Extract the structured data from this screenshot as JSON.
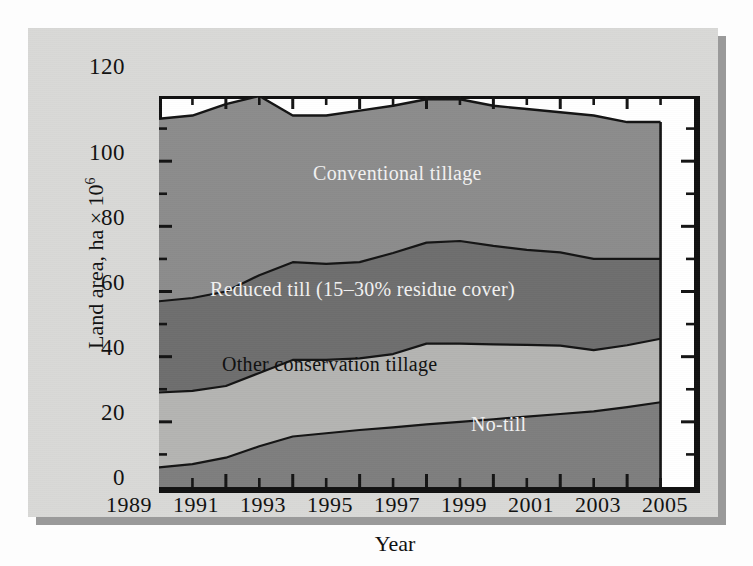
{
  "figure": {
    "background_color": "#d9d9d7",
    "shadow_color": "#9a9a9a",
    "frame_color": "#111111"
  },
  "axes": {
    "y_title_text": "Land area, ha × 10",
    "y_title_exponent": "6",
    "y_title_full": "Land area, ha × 10⁶",
    "x_title": "Year",
    "y_ticks": [
      "0",
      "20",
      "40",
      "60",
      "80",
      "100",
      "120"
    ],
    "y_tick_values": [
      0,
      20,
      40,
      60,
      80,
      100,
      120
    ],
    "y_minor_tick_values": [
      10,
      30,
      50,
      70,
      90,
      110
    ],
    "x_ticks": [
      "1989",
      "1991",
      "1993",
      "1995",
      "1997",
      "1999",
      "2001",
      "2003",
      "2005"
    ],
    "x_tick_values": [
      1989,
      1991,
      1993,
      1995,
      1997,
      1999,
      2001,
      2003,
      2005
    ],
    "x_minor_tick_values": [
      1990,
      1992,
      1994,
      1996,
      1998,
      2000,
      2002,
      2004
    ],
    "ylim": [
      0,
      120
    ],
    "xlim": [
      1989,
      2005
    ]
  },
  "series_labels": {
    "conventional": "Conventional tillage",
    "reduced": "Reduced till (15–30% residue cover)",
    "other": "Other conservation tillage",
    "notill": "No-till"
  },
  "colors": {
    "conventional": "#8c8c8c",
    "reduced": "#6e6e6e",
    "other": "#b4b4b2",
    "notill": "#7e7e7e",
    "plot_background": "#ffffff",
    "line": "#141414",
    "label_light": "#f2f2f2",
    "label_dark": "#101010"
  },
  "chart_data": {
    "type": "area",
    "title": "",
    "subtitle": "",
    "xlabel": "Year",
    "ylabel": "Land area, ha × 10⁶",
    "xlim": [
      1989,
      2005
    ],
    "ylim": [
      0,
      120
    ],
    "grid": false,
    "legend": "inline-labels",
    "stacked": true,
    "x": [
      1989,
      1990,
      1991,
      1992,
      1993,
      1994,
      1995,
      1996,
      1997,
      1998,
      1999,
      2000,
      2001,
      2002,
      2003,
      2004
    ],
    "series": [
      {
        "name": "No-till",
        "color": "#7e7e7e",
        "values": [
          6.0,
          7.0,
          9.0,
          12.5,
          15.5,
          16.5,
          17.5,
          18.3,
          19.2,
          20.0,
          20.8,
          21.6,
          22.4,
          23.2,
          24.5,
          26.0
        ]
      },
      {
        "name": "Other conservation tillage",
        "color": "#b4b4b2",
        "values": [
          23.0,
          22.5,
          22.0,
          22.5,
          23.5,
          22.5,
          22.0,
          22.5,
          24.8,
          24.0,
          23.0,
          22.0,
          21.0,
          18.8,
          19.0,
          19.5
        ]
      },
      {
        "name": "Reduced till (15–30% residue cover)",
        "color": "#6e6e6e",
        "values": [
          28.0,
          28.5,
          29.0,
          30.0,
          30.0,
          29.5,
          29.5,
          31.0,
          31.0,
          31.5,
          30.2,
          29.2,
          28.6,
          28.0,
          26.5,
          24.5
        ]
      },
      {
        "name": "Conventional tillage",
        "color": "#8c8c8c",
        "values": [
          56.0,
          56.0,
          57.5,
          55.0,
          45.0,
          45.5,
          46.5,
          45.2,
          44.0,
          43.5,
          43.0,
          43.2,
          43.0,
          44.0,
          42.0,
          42.0
        ]
      }
    ],
    "cumulative_boundaries": {
      "notill_top": [
        6.0,
        7.0,
        9.0,
        12.5,
        15.5,
        16.5,
        17.5,
        18.3,
        19.2,
        20.0,
        20.8,
        21.6,
        22.4,
        23.2,
        24.5,
        26.0
      ],
      "other_top": [
        29.0,
        29.5,
        31.0,
        35.0,
        39.0,
        39.0,
        39.5,
        40.8,
        44.0,
        44.0,
        43.8,
        43.6,
        43.4,
        42.0,
        43.5,
        45.5
      ],
      "reduced_top": [
        57.0,
        58.0,
        60.0,
        65.0,
        69.0,
        68.5,
        69.0,
        71.8,
        75.0,
        75.5,
        74.0,
        72.8,
        72.0,
        70.0,
        70.0,
        70.0
      ],
      "total_top": [
        113.0,
        114.0,
        117.5,
        120.0,
        114.0,
        114.0,
        115.5,
        117.0,
        119.0,
        119.0,
        117.0,
        116.0,
        115.0,
        114.0,
        112.0,
        112.0
      ]
    }
  }
}
